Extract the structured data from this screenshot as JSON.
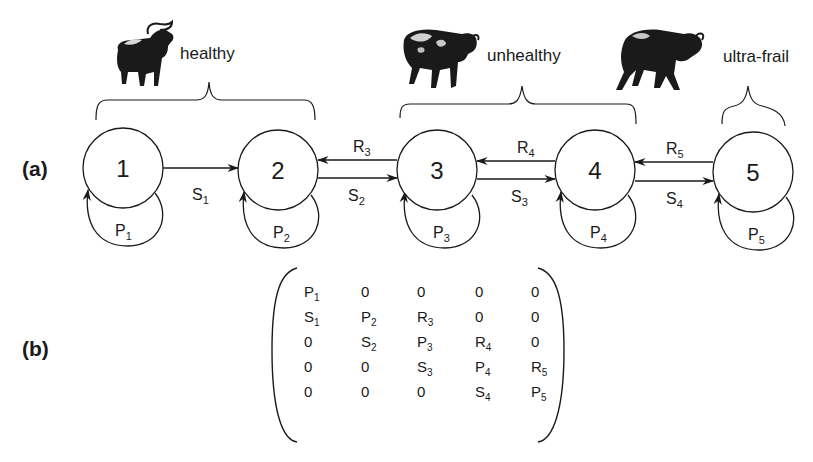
{
  "panels": {
    "a": {
      "label": "(a)"
    },
    "b": {
      "label": "(b)"
    }
  },
  "groups": [
    {
      "label": "healthy",
      "icon": "buffalo-healthy-icon",
      "spans_states": [
        1,
        2
      ]
    },
    {
      "label": "unhealthy",
      "icon": "buffalo-unhealthy-icon",
      "spans_states": [
        3,
        4
      ]
    },
    {
      "label": "ultra-frail",
      "icon": "buffalo-ultra-frail-icon",
      "spans_states": [
        5
      ]
    }
  ],
  "states": [
    {
      "id": "1",
      "self_loop": {
        "base": "P",
        "sub": "1"
      }
    },
    {
      "id": "2",
      "self_loop": {
        "base": "P",
        "sub": "2"
      }
    },
    {
      "id": "3",
      "self_loop": {
        "base": "P",
        "sub": "3"
      }
    },
    {
      "id": "4",
      "self_loop": {
        "base": "P",
        "sub": "4"
      }
    },
    {
      "id": "5",
      "self_loop": {
        "base": "P",
        "sub": "5"
      }
    }
  ],
  "transitions": {
    "forward": [
      {
        "from": "1",
        "to": "2",
        "base": "S",
        "sub": "1"
      },
      {
        "from": "2",
        "to": "3",
        "base": "S",
        "sub": "2"
      },
      {
        "from": "3",
        "to": "4",
        "base": "S",
        "sub": "3"
      },
      {
        "from": "4",
        "to": "5",
        "base": "S",
        "sub": "4"
      }
    ],
    "backward": [
      {
        "from": "3",
        "to": "2",
        "base": "R",
        "sub": "3"
      },
      {
        "from": "4",
        "to": "3",
        "base": "R",
        "sub": "4"
      },
      {
        "from": "5",
        "to": "4",
        "base": "R",
        "sub": "5"
      }
    ]
  },
  "matrix": {
    "rows": [
      [
        {
          "b": "P",
          "s": "1"
        },
        {
          "b": "0",
          "s": ""
        },
        {
          "b": "0",
          "s": ""
        },
        {
          "b": "0",
          "s": ""
        },
        {
          "b": "0",
          "s": ""
        }
      ],
      [
        {
          "b": "S",
          "s": "1"
        },
        {
          "b": "P",
          "s": "2"
        },
        {
          "b": "R",
          "s": "3"
        },
        {
          "b": "0",
          "s": ""
        },
        {
          "b": "0",
          "s": ""
        }
      ],
      [
        {
          "b": "0",
          "s": ""
        },
        {
          "b": "S",
          "s": "2"
        },
        {
          "b": "P",
          "s": "3"
        },
        {
          "b": "R",
          "s": "4"
        },
        {
          "b": "0",
          "s": ""
        }
      ],
      [
        {
          "b": "0",
          "s": ""
        },
        {
          "b": "0",
          "s": ""
        },
        {
          "b": "S",
          "s": "3"
        },
        {
          "b": "P",
          "s": "4"
        },
        {
          "b": "R",
          "s": "5"
        }
      ],
      [
        {
          "b": "0",
          "s": ""
        },
        {
          "b": "0",
          "s": ""
        },
        {
          "b": "0",
          "s": ""
        },
        {
          "b": "S",
          "s": "4"
        },
        {
          "b": "P",
          "s": "5"
        }
      ]
    ]
  },
  "colors": {
    "ink": "#1a1a1a",
    "background": "#ffffff"
  }
}
